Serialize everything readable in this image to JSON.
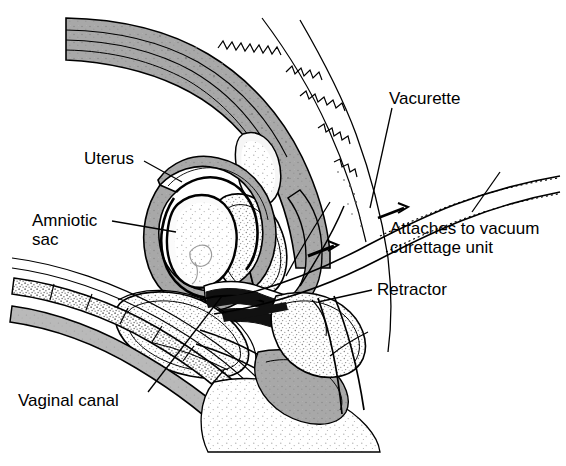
{
  "figure": {
    "background_color": "#ffffff",
    "ink_color": "#000000",
    "tissue_gray": "#a8a8a8",
    "tissue_light": "#d8d8d8",
    "stipple_gray": "#6f6f6f"
  },
  "labels": [
    {
      "id": "uterus",
      "text": "Uterus",
      "x": 84,
      "y": 149,
      "align": "left",
      "leader": true
    },
    {
      "id": "amniotic-sac",
      "line1": "Amniotic",
      "line2": "sac",
      "text": "Amniotic sac",
      "x": 32,
      "y": 211,
      "align": "left",
      "leader": true
    },
    {
      "id": "vaginal-canal",
      "text": "Vaginal canal",
      "x": 18,
      "y": 391,
      "align": "left",
      "leader": true
    },
    {
      "id": "vacurette",
      "text": "Vacurette",
      "x": 389,
      "y": 89,
      "align": "left",
      "leader": true
    },
    {
      "id": "attaches-to-vacuum",
      "line1": "Attaches to vacuum",
      "line2": "curettage unit",
      "text": "Attaches to vacuum curettage unit",
      "x": 390,
      "y": 219,
      "align": "left",
      "leader": true
    },
    {
      "id": "retractor",
      "text": "Retractor",
      "x": 377,
      "y": 280,
      "align": "left",
      "leader": true
    }
  ],
  "structures": [
    "anterior-uterine-wall",
    "posterior-uterine-wall",
    "uterine-cavity",
    "amniotic-sac",
    "cervix",
    "vaginal-canal",
    "bladder",
    "pubic-symphysis",
    "rectum",
    "vacurette-cannula",
    "retractor-blade"
  ]
}
